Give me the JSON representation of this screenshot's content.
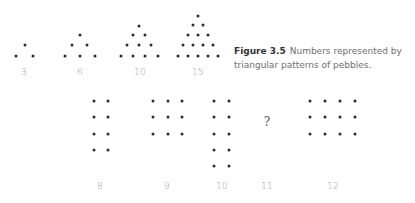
{
  "caption": {
    "label": "Figure 3.5",
    "text": "Numbers represented by triangular patterns of pebbles."
  },
  "triangles": [
    {
      "label": "3",
      "label_pos": [
        24,
        72
      ],
      "dots": [
        [
          25,
          45
        ],
        [
          16,
          56
        ],
        [
          33,
          56
        ]
      ]
    },
    {
      "label": "6",
      "label_pos": [
        80,
        72
      ],
      "dots": [
        [
          80,
          35
        ],
        [
          72,
          45
        ],
        [
          87,
          45
        ],
        [
          65,
          56
        ],
        [
          80,
          56
        ],
        [
          95,
          56
        ]
      ]
    },
    {
      "label": "10",
      "label_pos": [
        140,
        72
      ],
      "dots": [
        [
          139,
          26
        ],
        [
          133,
          35
        ],
        [
          145,
          35
        ],
        [
          127,
          45
        ],
        [
          139,
          45
        ],
        [
          151,
          45
        ],
        [
          121,
          56
        ],
        [
          133,
          56
        ],
        [
          145,
          56
        ],
        [
          158,
          56
        ]
      ]
    },
    {
      "label": "15",
      "label_pos": [
        198,
        72
      ],
      "dots": [
        [
          198,
          16
        ],
        [
          193,
          25
        ],
        [
          203,
          25
        ],
        [
          188,
          35
        ],
        [
          198,
          35
        ],
        [
          208,
          35
        ],
        [
          183,
          45
        ],
        [
          193,
          45
        ],
        [
          203,
          45
        ],
        [
          213,
          45
        ],
        [
          178,
          56
        ],
        [
          188,
          56
        ],
        [
          198,
          56
        ],
        [
          208,
          56
        ],
        [
          218,
          56
        ]
      ]
    }
  ],
  "rectangles": [
    {
      "label": "8",
      "label_pos": [
        100,
        186
      ],
      "cols": [
        94,
        108
      ],
      "rows": [
        101,
        117,
        134,
        150
      ]
    },
    {
      "label": "9",
      "label_pos": [
        167,
        186
      ],
      "cols": [
        153,
        168,
        182
      ],
      "rows": [
        101,
        117,
        134
      ]
    },
    {
      "label": "10",
      "label_pos": [
        222,
        186
      ],
      "cols": [
        214,
        229
      ],
      "rows": [
        101,
        117,
        134,
        150,
        166
      ]
    },
    {
      "label": "11",
      "label_pos": [
        267,
        186
      ],
      "cols": [],
      "rows": [],
      "placeholder": "?",
      "placeholder_pos": [
        267,
        122
      ]
    },
    {
      "label": "12",
      "label_pos": [
        333,
        186
      ],
      "cols": [
        310,
        325,
        340,
        355
      ],
      "rows": [
        101,
        117,
        134
      ]
    }
  ],
  "colors": {
    "dot": "#2b2b2b",
    "label": "#9a9a9a",
    "caption": "#6e6e6e"
  }
}
